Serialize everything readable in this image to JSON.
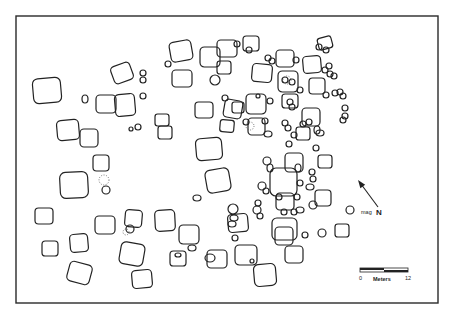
{
  "figure": {
    "type": "site-plan",
    "frame": {
      "x": 16,
      "y": 16,
      "w": 422,
      "h": 287
    }
  },
  "north_arrow": {
    "label_prefix": "mag",
    "label": "N",
    "x1": 378,
    "y1": 207,
    "x2": 358,
    "y2": 180
  },
  "scale_bar": {
    "title": "Meters",
    "start_label": "0",
    "end_label": "12",
    "x": 360,
    "y": 268,
    "w": 48,
    "h": 4
  },
  "features": {
    "rects": [
      [
        33,
        78,
        28,
        25,
        -5
      ],
      [
        112,
        64,
        20,
        18,
        -20
      ],
      [
        57,
        120,
        22,
        20,
        -5
      ],
      [
        96,
        95,
        20,
        18,
        0
      ],
      [
        115,
        94,
        20,
        22,
        -5
      ],
      [
        80,
        129,
        18,
        18,
        0
      ],
      [
        93,
        155,
        16,
        16,
        0
      ],
      [
        60,
        172,
        28,
        26,
        -3
      ],
      [
        35,
        208,
        18,
        16,
        0
      ],
      [
        70,
        234,
        18,
        18,
        -5
      ],
      [
        95,
        216,
        20,
        18,
        0
      ],
      [
        42,
        241,
        16,
        15,
        0
      ],
      [
        125,
        210,
        17,
        17,
        5
      ],
      [
        68,
        263,
        23,
        20,
        15
      ],
      [
        120,
        243,
        24,
        22,
        10
      ],
      [
        155,
        210,
        20,
        21,
        -3
      ],
      [
        132,
        270,
        20,
        18,
        -5
      ],
      [
        179,
        225,
        20,
        19,
        0
      ],
      [
        207,
        250,
        20,
        18,
        0
      ],
      [
        235,
        245,
        22,
        20,
        0
      ],
      [
        275,
        227,
        18,
        18,
        0
      ],
      [
        285,
        246,
        18,
        17,
        0
      ],
      [
        254,
        264,
        22,
        22,
        -5
      ],
      [
        172,
        70,
        20,
        17,
        0
      ],
      [
        170,
        41,
        22,
        20,
        -10
      ],
      [
        200,
        47,
        20,
        20,
        0
      ],
      [
        155,
        114,
        14,
        12,
        0
      ],
      [
        158,
        126,
        14,
        13,
        0
      ],
      [
        196,
        138,
        26,
        22,
        -5
      ],
      [
        206,
        169,
        24,
        23,
        -10
      ],
      [
        228,
        214,
        20,
        18,
        -5
      ],
      [
        217,
        40,
        20,
        17,
        0
      ],
      [
        246,
        94,
        20,
        20,
        0
      ],
      [
        243,
        36,
        16,
        15,
        0
      ],
      [
        252,
        64,
        20,
        18,
        5
      ],
      [
        276,
        50,
        18,
        17,
        0
      ],
      [
        282,
        94,
        16,
        14,
        0
      ],
      [
        285,
        153,
        18,
        19,
        0
      ],
      [
        278,
        71,
        20,
        21,
        0
      ],
      [
        302,
        108,
        18,
        18,
        0
      ],
      [
        303,
        56,
        18,
        17,
        -5
      ],
      [
        309,
        78,
        16,
        16,
        0
      ],
      [
        318,
        37,
        14,
        12,
        -15
      ],
      [
        318,
        155,
        14,
        13,
        0
      ],
      [
        315,
        190,
        16,
        16,
        0
      ],
      [
        270,
        168,
        27,
        28,
        0
      ],
      [
        276,
        193,
        18,
        17,
        0
      ],
      [
        335,
        224,
        14,
        13,
        0
      ],
      [
        272,
        218,
        25,
        22,
        0
      ],
      [
        170,
        251,
        16,
        15,
        0
      ],
      [
        248,
        118,
        17,
        17,
        0
      ],
      [
        296,
        127,
        14,
        13,
        0
      ],
      [
        224,
        100,
        18,
        18,
        10
      ],
      [
        220,
        120,
        14,
        12,
        5
      ],
      [
        195,
        102,
        18,
        16,
        0
      ],
      [
        232,
        102,
        12,
        11,
        0
      ],
      [
        217,
        61,
        14,
        13,
        0
      ]
    ],
    "ovals": [
      [
        143,
        73,
        3,
        3
      ],
      [
        143,
        80,
        3,
        3
      ],
      [
        143,
        96,
        3,
        3
      ],
      [
        85,
        99,
        3,
        4
      ],
      [
        131,
        129,
        2,
        2
      ],
      [
        106,
        190,
        4,
        4
      ],
      [
        215,
        80,
        5,
        5
      ],
      [
        130,
        229,
        4,
        4
      ],
      [
        138,
        127,
        3,
        3
      ],
      [
        197,
        198,
        4,
        3
      ],
      [
        178,
        255,
        3,
        2
      ],
      [
        210,
        258,
        5,
        4
      ],
      [
        192,
        248,
        4,
        3
      ],
      [
        252,
        261,
        2,
        2
      ],
      [
        233,
        209,
        5,
        5
      ],
      [
        234,
        218,
        4,
        3
      ],
      [
        232,
        224,
        4,
        3
      ],
      [
        257,
        210,
        4,
        4
      ],
      [
        260,
        216,
        3,
        3
      ],
      [
        262,
        186,
        4,
        4
      ],
      [
        266,
        191,
        3,
        3
      ],
      [
        258,
        203,
        3,
        3
      ],
      [
        284,
        212,
        3,
        3
      ],
      [
        300,
        210,
        4,
        3
      ],
      [
        294,
        212,
        3,
        3
      ],
      [
        313,
        205,
        4,
        4
      ],
      [
        322,
        233,
        4,
        4
      ],
      [
        265,
        121,
        3,
        3
      ],
      [
        268,
        134,
        4,
        3
      ],
      [
        267,
        161,
        4,
        4
      ],
      [
        285,
        123,
        3,
        3
      ],
      [
        288,
        128,
        3,
        3
      ],
      [
        294,
        135,
        3,
        3
      ],
      [
        289,
        144,
        3,
        3
      ],
      [
        237,
        44,
        3,
        3
      ],
      [
        249,
        50,
        3,
        3
      ],
      [
        268,
        58,
        3,
        3
      ],
      [
        272,
        61,
        3,
        3
      ],
      [
        285,
        80,
        3,
        3
      ],
      [
        292,
        82,
        3,
        3
      ],
      [
        290,
        102,
        3,
        3
      ],
      [
        292,
        107,
        3,
        3
      ],
      [
        270,
        101,
        3,
        3
      ],
      [
        303,
        124,
        3,
        3
      ],
      [
        309,
        122,
        3,
        3
      ],
      [
        317,
        130,
        3,
        4
      ],
      [
        319,
        47,
        3,
        3
      ],
      [
        326,
        50,
        3,
        3
      ],
      [
        325,
        70,
        3,
        3
      ],
      [
        329,
        66,
        3,
        3
      ],
      [
        334,
        76,
        3,
        3
      ],
      [
        340,
        92,
        3,
        3
      ],
      [
        343,
        96,
        3,
        3
      ],
      [
        345,
        108,
        3,
        3
      ],
      [
        345,
        116,
        3,
        3
      ],
      [
        320,
        133,
        4,
        3
      ],
      [
        316,
        148,
        3,
        3
      ],
      [
        312,
        172,
        3,
        3
      ],
      [
        313,
        179,
        3,
        3
      ],
      [
        310,
        187,
        4,
        3
      ],
      [
        350,
        210,
        4,
        4
      ],
      [
        305,
        235,
        3,
        3
      ],
      [
        335,
        93,
        3,
        3
      ],
      [
        343,
        120,
        3,
        3
      ],
      [
        300,
        90,
        3,
        3
      ],
      [
        330,
        74,
        3,
        3
      ],
      [
        296,
        60,
        3,
        3
      ],
      [
        326,
        95,
        3,
        3
      ],
      [
        246,
        122,
        3,
        3
      ],
      [
        235,
        238,
        3,
        3
      ],
      [
        168,
        64,
        3,
        3
      ],
      [
        225,
        98,
        3,
        3
      ],
      [
        258,
        96,
        2,
        2
      ],
      [
        270,
        168,
        3,
        4
      ],
      [
        298,
        168,
        3,
        4
      ],
      [
        279,
        197,
        3,
        3
      ],
      [
        297,
        197,
        3,
        3
      ],
      [
        300,
        183,
        3,
        3
      ]
    ],
    "dotted": [
      [
        104,
        180,
        5
      ],
      [
        287,
        80,
        4
      ],
      [
        250,
        126,
        4
      ],
      [
        126,
        232,
        3
      ]
    ]
  }
}
